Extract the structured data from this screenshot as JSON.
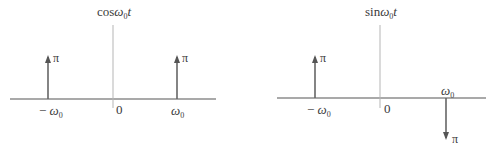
{
  "panels": [
    {
      "id": "cos",
      "title": {
        "func": "cos",
        "var": "ω",
        "sub": "0",
        "t": "t"
      },
      "impulses": [
        {
          "position": "-ω0",
          "height": "π",
          "direction": "up"
        },
        {
          "position": "ω0",
          "height": "π",
          "direction": "up"
        }
      ],
      "ticks": {
        "neg": {
          "sign": "−",
          "var": "ω",
          "sub": "0"
        },
        "zero": "0",
        "pos": {
          "var": "ω",
          "sub": "0"
        }
      },
      "impulse_label": "π"
    },
    {
      "id": "sin",
      "title": {
        "func": "sin",
        "var": "ω",
        "sub": "0",
        "t": "t"
      },
      "impulses": [
        {
          "position": "-ω0",
          "height": "π",
          "direction": "up"
        },
        {
          "position": "ω0",
          "height": "π",
          "direction": "down"
        }
      ],
      "ticks": {
        "neg": {
          "sign": "−",
          "var": "ω",
          "sub": "0"
        },
        "zero": "0",
        "pos": {
          "var": "ω",
          "sub": "0"
        }
      },
      "impulse_label": "π"
    }
  ],
  "colors": {
    "axis": "#555555",
    "vaxis": "#b0b0b0",
    "arrow": "#666666"
  }
}
